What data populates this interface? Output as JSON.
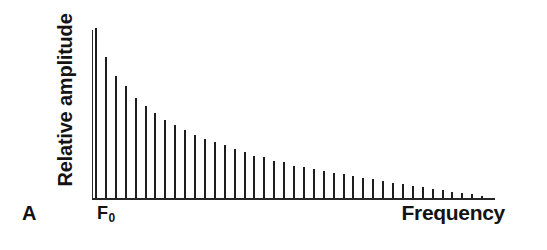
{
  "figure": {
    "panel_label": "A",
    "background_color": "#ffffff",
    "ink_color": "#1d1d1d"
  },
  "axes": {
    "ylabel": "Relative amplitude",
    "xlabel": "Frequency",
    "origin_tick_label": "F",
    "origin_tick_subscript": "0"
  },
  "chart_data": {
    "type": "bar",
    "title": "",
    "subtitle": "",
    "xlabel": "Frequency",
    "ylabel": "Relative amplitude",
    "annotations": [
      {
        "text": "A",
        "role": "panel-label",
        "position": "bottom-left"
      },
      {
        "text": "F0",
        "role": "x-axis-origin-tick",
        "position": "x-axis-left"
      }
    ],
    "legend": null,
    "legend_position": "none",
    "grid": false,
    "xlim": [
      0,
      40
    ],
    "ylim": [
      0,
      100
    ],
    "x_tick_labels": [
      "F0",
      ""
    ],
    "y_tick_labels": [],
    "categories": [
      "F0",
      "H2",
      "H3",
      "H4",
      "H5",
      "H6",
      "H7",
      "H8",
      "H9",
      "H10",
      "H11",
      "H12",
      "H13",
      "H14",
      "H15",
      "H16",
      "H17",
      "H18",
      "H19",
      "H20",
      "H21",
      "H22",
      "H23",
      "H24",
      "H25",
      "H26",
      "H27",
      "H28",
      "H29",
      "H30",
      "H31",
      "H32",
      "H33",
      "H34",
      "H35",
      "H36",
      "H37",
      "H38",
      "H39",
      "H40"
    ],
    "values": [
      100,
      83,
      72,
      66,
      59,
      54,
      50,
      46,
      43,
      40,
      37,
      35,
      33,
      31,
      29,
      27,
      25,
      24,
      22,
      21,
      19,
      18,
      17,
      16,
      15,
      14,
      13,
      12,
      11,
      10,
      9,
      8,
      7,
      6.2,
      5.4,
      4.6,
      3.8,
      3,
      2.2,
      1.4
    ]
  }
}
